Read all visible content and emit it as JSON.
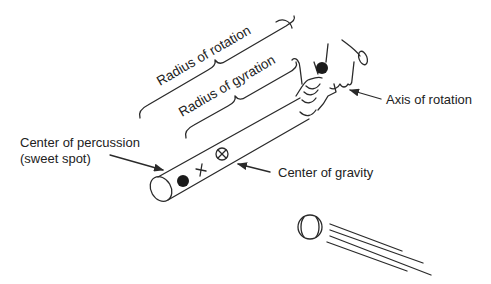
{
  "diagram": {
    "labels": {
      "radius_of_rotation": "Radius of rotation",
      "radius_of_gyration": "Radius of gyration",
      "center_of_percussion_line1": "Center of percussion",
      "center_of_percussion_line2": "(sweet spot)",
      "center_of_gravity": "Center of gravity",
      "axis_of_rotation": "Axis of rotation"
    },
    "markers": {
      "sweet_spot": "filled-dot",
      "gyration_point": "plus",
      "center_of_gravity": "circled-x",
      "axis_point": "filled-dot"
    },
    "elements": [
      "bat",
      "hands",
      "baseball",
      "motion-lines",
      "braces",
      "arrows"
    ]
  }
}
